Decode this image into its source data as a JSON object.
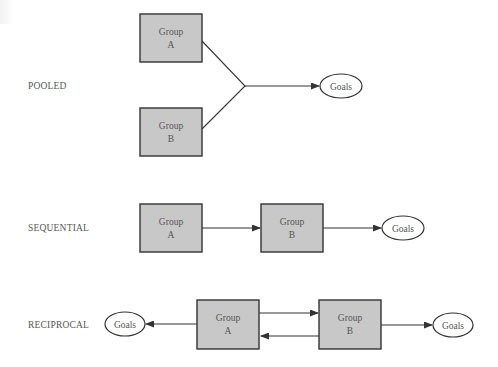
{
  "diagram": {
    "rows": [
      {
        "id": "pooled",
        "label": "POOLED",
        "groups": [
          {
            "line1": "Group",
            "line2": "A"
          },
          {
            "line1": "Group",
            "line2": "B"
          }
        ],
        "goals": [
          "Goals"
        ]
      },
      {
        "id": "sequential",
        "label": "SEQUENTIAL",
        "groups": [
          {
            "line1": "Group",
            "line2": "A"
          },
          {
            "line1": "Group",
            "line2": "B"
          }
        ],
        "goals": [
          "Goals"
        ]
      },
      {
        "id": "reciprocal",
        "label": "RECIPROCAL",
        "groups": [
          {
            "line1": "Group",
            "line2": "A"
          },
          {
            "line1": "Group",
            "line2": "B"
          }
        ],
        "goals": [
          "Goals",
          "Goals"
        ]
      }
    ],
    "colors": {
      "box_fill": "#c8c8c8",
      "stroke": "#333333",
      "text": "#555555"
    }
  }
}
